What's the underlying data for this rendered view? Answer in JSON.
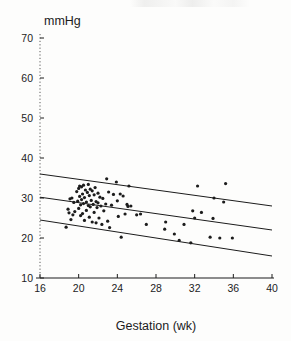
{
  "figure": {
    "background_color": "#fdfdfc",
    "ink_color": "#1c1c1c",
    "unit_label": "mmHg",
    "xaxis_title": "Gestation (wk)"
  },
  "chart_data": {
    "type": "scatter",
    "title": "",
    "subtitle": "",
    "xlabel": "Gestation (wk)",
    "ylabel": "mmHg",
    "xlim": [
      16,
      40
    ],
    "ylim": [
      10,
      70
    ],
    "xticks": [
      16,
      20,
      24,
      28,
      32,
      36,
      40
    ],
    "yticks": [
      10,
      20,
      30,
      40,
      50,
      60,
      70
    ],
    "xtick_labels": [
      "16",
      "20",
      "24",
      "28",
      "32",
      "36",
      "40"
    ],
    "ytick_labels": [
      "10",
      "20",
      "30",
      "40",
      "50",
      "60",
      "70"
    ],
    "grid": false,
    "legend": false,
    "legend_position": "none",
    "marker": "dot",
    "marker_color": "#1c1c1c",
    "marker_size": 1.6,
    "annotations": [
      "Y axis drawn as dashed vertical rule with inward ticks",
      "X axis drawn as solid horizontal rule with inward ticks",
      "Three parallel straight reference lines spanning full x range"
    ],
    "reference_lines": [
      {
        "name": "upper-limit-line",
        "x": [
          16,
          40
        ],
        "y": [
          36.0,
          28.0
        ],
        "style": "solid",
        "color": "#1c1c1c",
        "width": 1.0
      },
      {
        "name": "mean-line",
        "x": [
          16,
          40
        ],
        "y": [
          30.2,
          22.0
        ],
        "style": "solid",
        "color": "#1c1c1c",
        "width": 1.0
      },
      {
        "name": "lower-limit-line",
        "x": [
          16,
          40
        ],
        "y": [
          24.5,
          15.5
        ],
        "style": "solid",
        "color": "#1c1c1c",
        "width": 1.0
      }
    ],
    "series": [
      {
        "name": "observations",
        "points": [
          [
            18.7,
            22.7
          ],
          [
            18.9,
            27.2
          ],
          [
            19.0,
            26.3
          ],
          [
            19.1,
            29.8
          ],
          [
            19.2,
            24.6
          ],
          [
            19.3,
            30.0
          ],
          [
            19.4,
            25.8
          ],
          [
            19.5,
            28.9
          ],
          [
            19.6,
            26.6
          ],
          [
            19.8,
            31.6
          ],
          [
            19.9,
            29.2
          ],
          [
            20.0,
            32.4
          ],
          [
            20.0,
            27.4
          ],
          [
            20.1,
            33.0
          ],
          [
            20.1,
            30.4
          ],
          [
            20.2,
            28.3
          ],
          [
            20.2,
            25.6
          ],
          [
            20.3,
            32.8
          ],
          [
            20.3,
            29.6
          ],
          [
            20.4,
            31.0
          ],
          [
            20.4,
            26.1
          ],
          [
            20.5,
            33.2
          ],
          [
            20.5,
            28.6
          ],
          [
            20.6,
            30.1
          ],
          [
            20.6,
            24.4
          ],
          [
            20.7,
            32.0
          ],
          [
            20.8,
            29.0
          ],
          [
            20.8,
            26.9
          ],
          [
            20.9,
            31.4
          ],
          [
            21.0,
            33.4
          ],
          [
            21.0,
            28.1
          ],
          [
            21.1,
            30.6
          ],
          [
            21.1,
            25.2
          ],
          [
            21.2,
            32.2
          ],
          [
            21.2,
            27.8
          ],
          [
            21.3,
            29.4
          ],
          [
            21.4,
            31.8
          ],
          [
            21.4,
            24.0
          ],
          [
            21.5,
            28.4
          ],
          [
            21.6,
            30.8
          ],
          [
            21.6,
            26.4
          ],
          [
            21.7,
            32.6
          ],
          [
            21.8,
            29.1
          ],
          [
            21.8,
            23.8
          ],
          [
            21.9,
            27.6
          ],
          [
            22.0,
            31.2
          ],
          [
            22.0,
            28.8
          ],
          [
            22.1,
            25.0
          ],
          [
            22.2,
            30.2
          ],
          [
            22.3,
            28.0
          ],
          [
            22.4,
            23.4
          ],
          [
            22.5,
            29.9
          ],
          [
            22.6,
            26.8
          ],
          [
            22.8,
            28.5
          ],
          [
            22.9,
            34.8
          ],
          [
            23.0,
            24.2
          ],
          [
            23.1,
            31.5
          ],
          [
            23.2,
            22.6
          ],
          [
            23.4,
            28.2
          ],
          [
            23.6,
            30.9
          ],
          [
            23.9,
            34.0
          ],
          [
            24.0,
            29.3
          ],
          [
            24.1,
            25.4
          ],
          [
            24.3,
            31.0
          ],
          [
            24.4,
            20.2
          ],
          [
            24.6,
            30.5
          ],
          [
            24.8,
            26.0
          ],
          [
            25.0,
            28.4
          ],
          [
            25.1,
            27.9
          ],
          [
            25.2,
            33.0
          ],
          [
            25.4,
            28.0
          ],
          [
            26.0,
            25.8
          ],
          [
            26.4,
            26.0
          ],
          [
            27.0,
            23.4
          ],
          [
            28.9,
            22.2
          ],
          [
            29.0,
            24.0
          ],
          [
            29.9,
            21.0
          ],
          [
            30.4,
            19.4
          ],
          [
            30.9,
            23.4
          ],
          [
            31.6,
            18.8
          ],
          [
            31.8,
            26.8
          ],
          [
            32.0,
            25.0
          ],
          [
            32.3,
            33.0
          ],
          [
            32.7,
            26.4
          ],
          [
            33.6,
            20.2
          ],
          [
            33.9,
            24.9
          ],
          [
            34.0,
            30.0
          ],
          [
            34.6,
            20.0
          ],
          [
            35.0,
            29.0
          ],
          [
            35.2,
            33.6
          ],
          [
            35.9,
            20.0
          ]
        ]
      }
    ]
  }
}
